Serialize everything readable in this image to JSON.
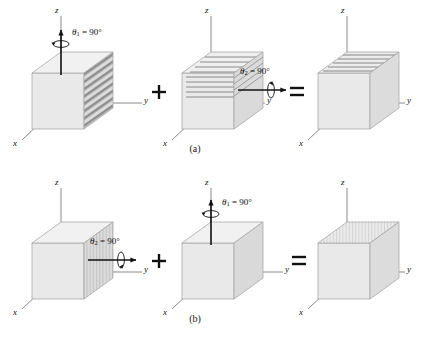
{
  "figure": {
    "background": "#ffffff",
    "width": 425,
    "height": 341,
    "colors": {
      "cube_front": "#e7e7e7",
      "cube_top": "#efefef",
      "cube_right": "#d8d8d8",
      "cube_edge": "#9a9a9a",
      "axis": "#808080",
      "arrow": "#111111",
      "stripe": "#8d8d8d",
      "text": "#111111"
    },
    "captions": [
      {
        "id": "a",
        "label": "(a)"
      },
      {
        "id": "b",
        "label": "(b)"
      }
    ],
    "rows": [
      {
        "id": "a",
        "caption": "(a)",
        "operators": [
          "+",
          "="
        ],
        "panels": [
          {
            "index": 1,
            "axes": [
              "z",
              "y",
              "x"
            ],
            "rotation_label": "θ₁ = 90°",
            "rotation_symbol": "θ",
            "rotation_subscript": "1",
            "rotation_value": "= 90°",
            "rotation_axis": "z",
            "arrow_direction": "up",
            "stripes": {
              "face": "right",
              "orientation": "diagonal"
            }
          },
          {
            "index": 2,
            "axes": [
              "z",
              "y",
              "x"
            ],
            "rotation_label": "θ₂ = 90°",
            "rotation_symbol": "θ",
            "rotation_subscript": "2",
            "rotation_value": "= 90°",
            "rotation_axis": "y",
            "arrow_direction": "right",
            "stripes": {
              "face": "right",
              "orientation": "horizontal"
            }
          },
          {
            "index": 3,
            "axes": [
              "z",
              "y",
              "x"
            ],
            "rotation_label": "",
            "rotation_axis": "none",
            "arrow_direction": "none",
            "stripes": {
              "face": "top",
              "orientation": "horizontal"
            }
          }
        ]
      },
      {
        "id": "b",
        "caption": "(b)",
        "operators": [
          "+",
          "="
        ],
        "panels": [
          {
            "index": 1,
            "axes": [
              "z",
              "y",
              "x"
            ],
            "rotation_label": "θ₂ = 90°",
            "rotation_symbol": "θ",
            "rotation_subscript": "2",
            "rotation_value": "= 90°",
            "rotation_axis": "y",
            "arrow_direction": "right",
            "stripes": {
              "face": "right",
              "orientation": "vertical"
            }
          },
          {
            "index": 2,
            "axes": [
              "z",
              "y",
              "x"
            ],
            "rotation_label": "θ₁ = 90°",
            "rotation_symbol": "θ",
            "rotation_subscript": "1",
            "rotation_value": "= 90°",
            "rotation_axis": "z",
            "arrow_direction": "up",
            "stripes": {
              "face": "none",
              "orientation": "none"
            }
          },
          {
            "index": 3,
            "axes": [
              "z",
              "y",
              "x"
            ],
            "rotation_label": "",
            "rotation_axis": "none",
            "arrow_direction": "none",
            "stripes": {
              "face": "top",
              "orientation": "vertical"
            }
          }
        ]
      }
    ],
    "axis_labels": {
      "z": "z",
      "y": "y",
      "x": "x"
    },
    "operator_plus": "+",
    "operator_equals": "="
  }
}
